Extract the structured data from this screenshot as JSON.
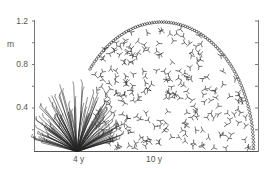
{
  "figure": {
    "type": "botanical-growth-diagram"
  },
  "axis": {
    "unit": "m",
    "ticks": [
      {
        "value": 1.2,
        "label": "1.2"
      },
      {
        "value": 0.8,
        "label": "0.8"
      },
      {
        "value": 0.4,
        "label": "0.4"
      }
    ],
    "minor_step": 0.2,
    "range": [
      0,
      1.2
    ]
  },
  "plants": [
    {
      "age_label": "4 y",
      "form": "upright twiggy bush",
      "height_m": 0.6,
      "width_px": 82
    },
    {
      "age_label": "10 y",
      "form": "dense leafy dome",
      "height_m": 1.2,
      "width_px": 175
    }
  ],
  "colors": {
    "ink": "#222222",
    "axis": "#777777",
    "text": "#555555",
    "background": "#ffffff"
  }
}
